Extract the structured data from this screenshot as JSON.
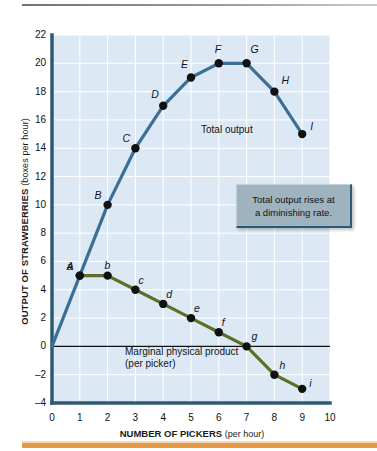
{
  "chart_data": {
    "type": "line",
    "title": "",
    "xlabel": "NUMBER OF PICKERS",
    "xlabel_unit": "(per hour)",
    "ylabel": "OUTPUT OF STRAWBERRIES",
    "ylabel_unit": "(boxes per hour)",
    "xlim": [
      0,
      10
    ],
    "ylim": [
      -4,
      22
    ],
    "xticks": [
      "0",
      "1",
      "2",
      "3",
      "4",
      "5",
      "6",
      "7",
      "8",
      "9",
      "10"
    ],
    "yticks": [
      "22",
      "20",
      "18",
      "16",
      "14",
      "12",
      "10",
      "8",
      "6",
      "4",
      "2",
      "0",
      "–2",
      "–4"
    ],
    "grid": true,
    "legend_position": "inline-annotation",
    "series": [
      {
        "name": "Total output",
        "label": "Total output",
        "color": "#3b6f96",
        "point_label_style": "uppercase-italic",
        "x": [
          0,
          1,
          2,
          3,
          4,
          5,
          6,
          7,
          8,
          9
        ],
        "values": [
          0,
          5,
          10,
          14,
          17,
          19,
          20,
          20,
          18,
          15
        ],
        "point_labels": [
          "",
          "A",
          "B",
          "C",
          "D",
          "E",
          "F",
          "G",
          "H",
          "I"
        ]
      },
      {
        "name": "Marginal physical product",
        "label": "Marginal physical product",
        "label_line2": "(per picker)",
        "color": "#5c6e27",
        "point_label_style": "lowercase-italic",
        "x": [
          1,
          2,
          3,
          4,
          5,
          6,
          7,
          8,
          9
        ],
        "values": [
          5,
          5,
          4,
          3,
          2,
          1,
          0,
          -2,
          -3
        ],
        "point_labels": [
          "a",
          "b",
          "c",
          "d",
          "e",
          "f",
          "g",
          "h",
          "i"
        ]
      }
    ],
    "annotations": [
      {
        "text_line1": "Total output rises at",
        "text_line2": "a diminishing rate."
      }
    ],
    "colors": {
      "plot_background": "#dce9f5",
      "grid": "#ffffff",
      "axis": "#2d5a73",
      "zero_line": "#111111",
      "total_output": "#3b6f96",
      "marginal_product": "#5c6e27",
      "callout_fill": "#9eb3bd",
      "callout_border": "#2d5a73",
      "rule_top": "#8d9398",
      "rule_bottom": "#e79a45"
    }
  }
}
